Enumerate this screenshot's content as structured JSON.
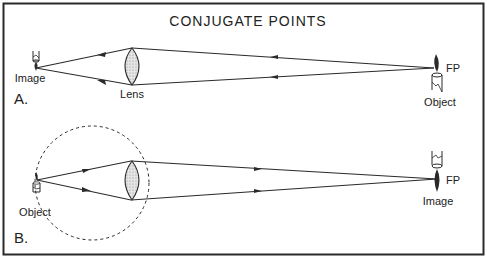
{
  "title": "CONJUGATE POINTS",
  "colors": {
    "ink": "#2a2a2a",
    "lens_fill": "#d9d9d9",
    "background": "#ffffff"
  },
  "panel_a": {
    "label": "A.",
    "image_label": "Image",
    "lens_label": "Lens",
    "fp_label": "FP",
    "object_label": "Object",
    "ray_direction": "right-to-left"
  },
  "panel_b": {
    "label": "B.",
    "object_label": "Object",
    "image_label": "Image",
    "fp_label": "FP",
    "ray_direction": "left-to-right",
    "dashed_circle": true
  }
}
